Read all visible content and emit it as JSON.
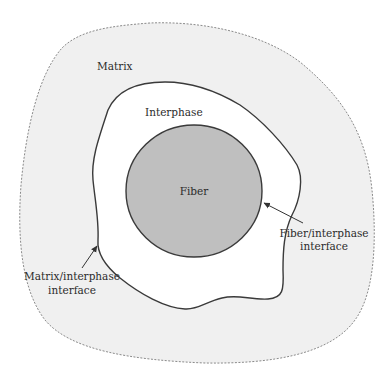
{
  "diagram": {
    "type": "fiber-interphase-matrix cross-section",
    "regions": {
      "matrix": {
        "label": "Matrix",
        "fill": "#f0f0f0",
        "border": "dashed",
        "border_color": "#8a8a8a"
      },
      "interphase": {
        "label": "Interphase",
        "fill": "#ffffff",
        "border_color": "#3a3a3a"
      },
      "fiber": {
        "label": "Fiber",
        "fill": "#bfbfbf",
        "border_color": "#3a3a3a"
      }
    },
    "annotations": {
      "matrix_interphase": {
        "line1": "Matrix/interphase",
        "line2": "interface"
      },
      "fiber_interphase": {
        "line1": "Fiber/interphase",
        "line2": "interface"
      }
    }
  }
}
